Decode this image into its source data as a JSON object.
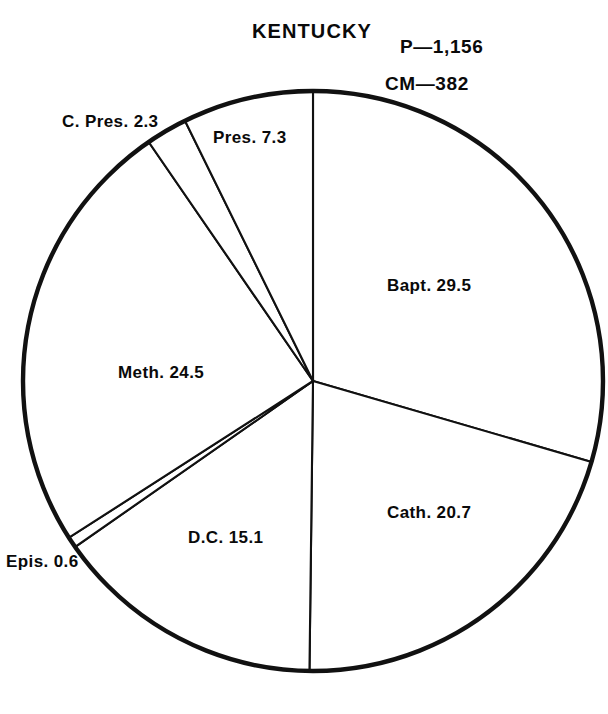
{
  "chart": {
    "title": "KENTUCKY",
    "stats": {
      "population": "P—1,156",
      "church_members": "CM—382"
    }
  },
  "labels": {
    "cpres": "C. Pres. 2.3",
    "pres": "Pres. 7.3",
    "bapt": "Bapt. 29.5",
    "meth": "Meth. 24.5",
    "cath": "Cath. 20.7",
    "dc": "D.C. 15.1",
    "epis": "Epis. 0.6"
  },
  "chart_data": {
    "type": "pie",
    "title": "KENTUCKY",
    "subtitle": "",
    "xlabel": "",
    "ylabel": "",
    "grid": false,
    "legend_position": "none",
    "value_unit": "percent",
    "start_angle_deg": 0,
    "direction": "clockwise",
    "annotations": [
      "P—1,156",
      "CM—382"
    ],
    "annotation_meanings": {
      "P—1,156": "Population 1,156 (thousands)",
      "CM—382": "Church Members 382 (thousands)"
    },
    "categories": [
      "Bapt.",
      "Cath.",
      "D.C.",
      "Epis.",
      "Meth.",
      "C. Pres.",
      "Pres."
    ],
    "values": [
      29.5,
      20.7,
      15.1,
      0.6,
      24.5,
      2.3,
      7.3
    ],
    "slices": [
      {
        "label": "Bapt. 29.5",
        "name": "Bapt.",
        "value": 29.5,
        "start_deg": 0.0,
        "end_deg": 106.2
      },
      {
        "label": "Cath. 20.7",
        "name": "Cath.",
        "value": 20.7,
        "start_deg": 106.2,
        "end_deg": 180.7
      },
      {
        "label": "D.C. 15.1",
        "name": "D.C.",
        "value": 15.1,
        "start_deg": 180.7,
        "end_deg": 235.1
      },
      {
        "label": "Epis. 0.6",
        "name": "Epis.",
        "value": 0.6,
        "start_deg": 235.1,
        "end_deg": 237.3
      },
      {
        "label": "Meth. 24.5",
        "name": "Meth.",
        "value": 24.5,
        "start_deg": 237.3,
        "end_deg": 325.5
      },
      {
        "label": "C. Pres. 2.3",
        "name": "C. Pres.",
        "value": 2.3,
        "start_deg": 325.5,
        "end_deg": 333.8
      },
      {
        "label": "Pres. 7.3",
        "name": "Pres.",
        "value": 7.3,
        "start_deg": 333.8,
        "end_deg": 360.0
      }
    ],
    "total": 100.0,
    "geometry": {
      "cx": 313,
      "cy": 381,
      "r": 290
    },
    "colors": {
      "stroke": "#111111",
      "fill": "#ffffff",
      "text": "#0a0a0a"
    }
  }
}
